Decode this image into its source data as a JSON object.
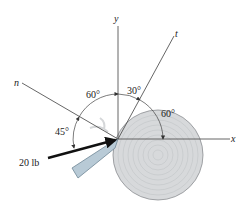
{
  "axes": {
    "x_label": "x",
    "y_label": "y",
    "n_label": "n",
    "t_label": "t"
  },
  "angles": {
    "n_to_y": "60°",
    "y_to_t": "30°",
    "t_to_x": "60°",
    "force_to_n": "45°"
  },
  "force": {
    "label": "20 lb"
  },
  "colors": {
    "disk_fill": "#d7d9db",
    "disk_ring": "#b9bcbf",
    "tool_fill": "#b8cad6",
    "line": "#555555",
    "arrow": "#111111"
  }
}
